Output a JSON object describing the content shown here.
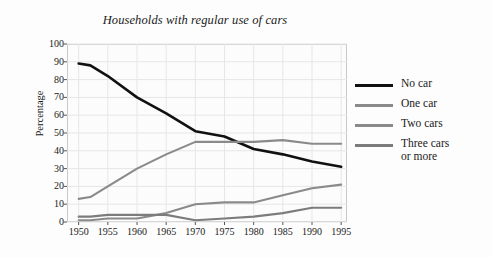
{
  "chart_data": {
    "type": "line",
    "title": "Households with regular use of cars",
    "xlabel": "",
    "ylabel": "Percentage",
    "xlim": [
      1948,
      1996
    ],
    "ylim": [
      0,
      100
    ],
    "yticks": [
      0,
      10,
      20,
      30,
      40,
      50,
      60,
      70,
      80,
      90,
      100
    ],
    "xticks": [
      1950,
      1955,
      1960,
      1965,
      1970,
      1975,
      1980,
      1985,
      1990,
      1995
    ],
    "grid": true,
    "legend_position": "right",
    "x": [
      1950,
      1952,
      1955,
      1960,
      1965,
      1970,
      1975,
      1980,
      1985,
      1990,
      1995
    ],
    "series": [
      {
        "name": "No car",
        "color": "#111111",
        "values": [
          89,
          88,
          82,
          70,
          61,
          51,
          48,
          41,
          38,
          34,
          31
        ]
      },
      {
        "name": "One car",
        "color": "#8a8a8a",
        "values": [
          13,
          14,
          20,
          30,
          38,
          45,
          45,
          45,
          46,
          44,
          44
        ]
      },
      {
        "name": "Two cars",
        "color": "#8a8a8a",
        "values": [
          1,
          1,
          2,
          2,
          5,
          10,
          11,
          11,
          15,
          19,
          21
        ]
      },
      {
        "name": "Three cars\nor more",
        "color": "#7c7c7c",
        "values": [
          3,
          3,
          4,
          4,
          4,
          1,
          2,
          3,
          5,
          8,
          8
        ]
      }
    ]
  },
  "legend": {
    "items": [
      {
        "label": "No car",
        "color": "#111111"
      },
      {
        "label": "One car",
        "color": "#8a8a8a"
      },
      {
        "label": "Two cars",
        "color": "#8a8a8a"
      },
      {
        "label": "Three cars\nor more",
        "color": "#7c7c7c"
      }
    ]
  }
}
